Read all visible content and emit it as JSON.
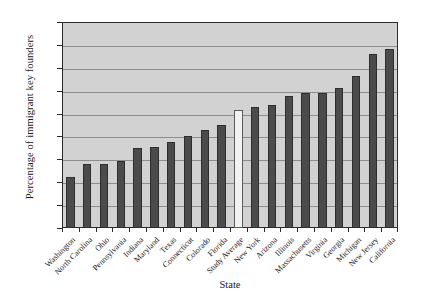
{
  "chart_data": {
    "type": "bar",
    "title": "",
    "xlabel": "State",
    "ylabel": "Percentage of immigrant key founders",
    "ylim": [
      0,
      45
    ],
    "ytick_step": 5,
    "yticks": [
      0,
      5,
      10,
      15,
      20,
      25,
      30,
      35,
      40,
      45
    ],
    "ytick_labels": [
      "0",
      "5",
      "10",
      "15",
      "20",
      "25",
      "30",
      "35",
      "40",
      "45"
    ],
    "grid": true,
    "grid_axis": "y",
    "legend": null,
    "categories": [
      "Washington",
      "North Carolina",
      "Ohio",
      "Pennsylvania",
      "Indiana",
      "Maryland",
      "Texas",
      "Connecticut",
      "Colorado",
      "Florida",
      "Study Average",
      "New York",
      "Arizona",
      "Illinois",
      "Massachusetts",
      "Virginia",
      "Georgia",
      "Michigan",
      "New Jersey",
      "California"
    ],
    "values": [
      11.2,
      14.0,
      14.0,
      14.6,
      17.4,
      17.6,
      18.8,
      20.1,
      21.4,
      22.4,
      25.8,
      26.4,
      26.8,
      28.8,
      29.6,
      29.6,
      30.6,
      33.2,
      38.1,
      39.1
    ],
    "colors": {
      "bar": "#4b4b4b",
      "highlight_bar": "#f2f2f0",
      "plot_background": "#d2d2d2",
      "gridline": "#8d8d8d",
      "axis": "#2b2b2b",
      "text": "#1a1a1a",
      "figure_background": "#ffffff"
    },
    "highlight_index": 10
  }
}
